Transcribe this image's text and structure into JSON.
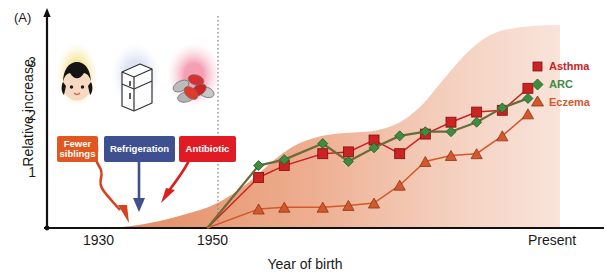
{
  "figure": {
    "panel_label": "(A)",
    "axes": {
      "ylabel": "Relative increase",
      "xlabel": "Year of birth",
      "yticks": [
        "1",
        "2",
        "3"
      ],
      "xticks": [
        "1930",
        "1950",
        "Present"
      ]
    }
  },
  "factors": [
    {
      "name": "fewer-siblings",
      "label": "Fewer siblings",
      "box_color": "#e2561f",
      "glow_color": "#f2e07a",
      "icon": "child-face-icon",
      "arrow_color": "#d9411e",
      "arrow_style": "squiggle"
    },
    {
      "name": "refrigeration",
      "label": "Refrigeration",
      "box_color": "#3f5090",
      "glow_color": "#dfe4f2",
      "icon": "refrigerator-icon",
      "arrow_color": "#3f5090",
      "arrow_style": "straight"
    },
    {
      "name": "antibiotic",
      "label": "Antibiotic",
      "box_color": "#e01b24",
      "glow_color": "#f7b8c4",
      "icon": "pills-icon",
      "arrow_color": "#d9201c",
      "arrow_style": "curve"
    }
  ],
  "legend": [
    {
      "label": "Asthma",
      "color": "#cc2222",
      "marker": "square"
    },
    {
      "label": "ARC",
      "color": "#3d8c40",
      "marker": "diamond"
    },
    {
      "label": "Eczema",
      "color": "#d4582b",
      "marker": "triangle"
    }
  ],
  "chart_data": {
    "type": "line",
    "title": "",
    "xlabel": "Year of birth",
    "ylabel": "Relative increase",
    "xlim": [
      1925,
      2005
    ],
    "ylim": [
      0,
      3.6
    ],
    "xtick_values": [
      1930,
      1950,
      2000
    ],
    "xtick_labels": [
      "1930",
      "1950",
      "Present"
    ],
    "ytick_values": [
      1,
      2,
      3
    ],
    "grid": false,
    "legend_position": "right",
    "annotations": [
      {
        "text": "Fewer siblings",
        "kind": "callout-box"
      },
      {
        "text": "Refrigeration",
        "kind": "callout-box"
      },
      {
        "text": "Antibiotic",
        "kind": "callout-box"
      },
      {
        "text": "dotted reference line at 1950",
        "kind": "vline"
      }
    ],
    "shaded_band": {
      "name": "hygiene-exposure-decline-band",
      "color": "#e8a183",
      "note": "broad orange band rising from 1930 baseline to plateau near Present",
      "x": [
        1930,
        1942,
        1950,
        1958,
        1966,
        1972,
        1980,
        1990,
        2000
      ],
      "y": [
        0.0,
        0.25,
        0.5,
        1.0,
        1.45,
        1.6,
        2.4,
        3.2,
        3.4
      ]
    },
    "series": [
      {
        "name": "Asthma",
        "color": "#cc2222",
        "marker": "square",
        "x": [
          1950,
          1958,
          1962,
          1968,
          1972,
          1976,
          1980,
          1984,
          1988,
          1992,
          1996,
          2000
        ],
        "values": [
          0.0,
          0.85,
          1.05,
          1.25,
          1.28,
          1.48,
          1.25,
          1.58,
          1.78,
          1.95,
          1.98,
          2.35
        ]
      },
      {
        "name": "ARC",
        "color": "#3d8c40",
        "marker": "diamond",
        "x": [
          1950,
          1958,
          1962,
          1968,
          1972,
          1976,
          1980,
          1984,
          1988,
          1992,
          1996,
          2000
        ],
        "values": [
          0.0,
          1.05,
          1.15,
          1.42,
          1.12,
          1.35,
          1.55,
          1.62,
          1.62,
          1.78,
          2.02,
          2.18
        ]
      },
      {
        "name": "Eczema",
        "color": "#d4582b",
        "marker": "triangle",
        "x": [
          1950,
          1958,
          1962,
          1968,
          1972,
          1976,
          1980,
          1984,
          1988,
          1992,
          1996,
          2000
        ],
        "values": [
          0.0,
          0.32,
          0.35,
          0.35,
          0.38,
          0.42,
          0.72,
          1.12,
          1.22,
          1.25,
          1.55,
          1.92
        ]
      }
    ]
  }
}
